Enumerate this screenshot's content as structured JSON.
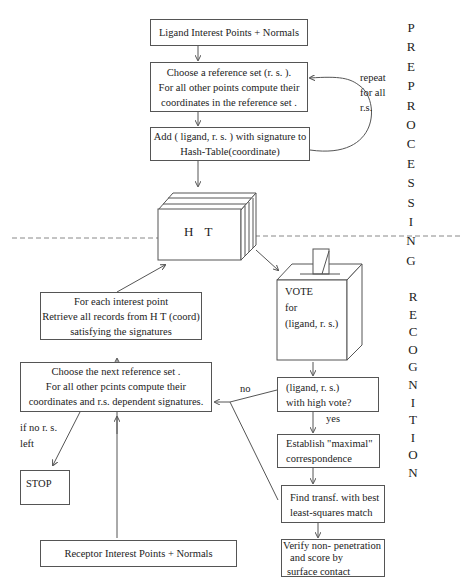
{
  "diagram": {
    "type": "flowchart",
    "sections": {
      "preprocessing": {
        "label": "PREPROCESSING",
        "letters": [
          "P",
          "R",
          "E",
          "P",
          "R",
          "O",
          "C",
          "E",
          "S",
          "S",
          "I",
          "N",
          "G"
        ]
      },
      "recognition": {
        "label": "RECOGNITION",
        "letters": [
          "R",
          "E",
          "C",
          "O",
          "G",
          "N",
          "I",
          "T",
          "I",
          "O",
          "N"
        ]
      }
    },
    "nodes": {
      "ligand_input": {
        "lines": [
          "Ligand  Interest  Points + Normals"
        ]
      },
      "choose_ref": {
        "lines": [
          "Choose a  reference  set  (r. s. ).",
          "For all other  points  compute their",
          "coordinates  in  the  reference  set ."
        ]
      },
      "add_hash": {
        "lines": [
          "Add  ( ligand,  r. s. )  with  signature  to",
          "Hash-Table(coordinate)"
        ]
      },
      "hash_table": {
        "label": "H T"
      },
      "vote": {
        "lines": [
          "VOTE",
          "for",
          "(ligand,  r. s.)"
        ]
      },
      "retrieve": {
        "lines": [
          "For each  interest  point",
          "Retrieve all records  from    H T (coord)",
          "satisfying  the   signatures"
        ]
      },
      "choose_next": {
        "lines": [
          "Choose the next   reference  set  .",
          "For all other  pcints  compute their",
          "coordinates  and  r.s.  dependent  signatures."
        ]
      },
      "high_vote": {
        "lines": [
          "(ligand,  r. s.)",
          "with high vote?"
        ]
      },
      "establish": {
        "lines": [
          "Establish \"maximal\"",
          "correspondence"
        ]
      },
      "find_transf": {
        "lines": [
          "Find transf. with best",
          "least-squares match"
        ]
      },
      "verify": {
        "lines": [
          "Verify  non- penetration",
          "and  score  by",
          "surface    contact"
        ]
      },
      "stop": {
        "lines": [
          "STOP"
        ]
      },
      "receptor_input": {
        "lines": [
          "Receptor    Interest  Points + Normals"
        ]
      }
    },
    "edge_labels": {
      "repeat": [
        "repeat",
        "for all",
        "r.s."
      ],
      "no": "no",
      "yes": "yes",
      "if_no_rs": [
        "if no  r. s.",
        "left"
      ]
    },
    "colors": {
      "line": "#555555",
      "dash": "#888888",
      "text": "#222222"
    }
  }
}
